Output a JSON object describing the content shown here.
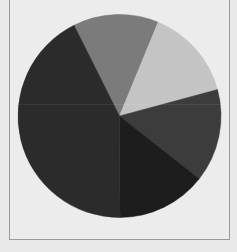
{
  "chart_data": {
    "type": "pie",
    "title": "",
    "legend": "none",
    "start_angle_deg_clockwise_from_top": -26.6,
    "slices": [
      {
        "label": "",
        "value": 13.6,
        "color": "#7b7b7b"
      },
      {
        "label": "",
        "value": 14.6,
        "color": "#c4c4c4"
      },
      {
        "label": "",
        "value": 14.8,
        "color": "#3c3c3c"
      },
      {
        "label": "",
        "value": 14.3,
        "color": "#1d1d1d"
      },
      {
        "label": "",
        "value": 42.7,
        "color": "#2b2b2b"
      }
    ],
    "background_color": "#ececec",
    "frame_color": "#9a9a9a"
  }
}
